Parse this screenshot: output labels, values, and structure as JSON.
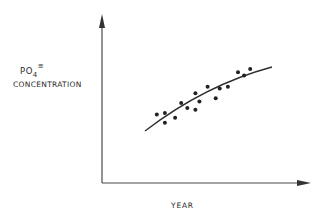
{
  "chart_data": {
    "type": "scatter",
    "title": "",
    "xlabel": "YEAR",
    "ylabel": "PO4≡ CONCENTRATION",
    "ylabel_parts": {
      "chem": "PO",
      "subscript": "4",
      "superscript": "≡",
      "line2": "CONCENTRATION"
    },
    "axes": {
      "ticks": false,
      "tick_labels": false,
      "grid": false,
      "arrows": true
    },
    "note": "Qualitative schematic: no numeric scale. Point coordinates are relative positions (0-100) within the plot area.",
    "points": [
      {
        "x": 27,
        "y": 42
      },
      {
        "x": 31,
        "y": 43
      },
      {
        "x": 31,
        "y": 37
      },
      {
        "x": 36,
        "y": 40
      },
      {
        "x": 39,
        "y": 49
      },
      {
        "x": 42,
        "y": 46
      },
      {
        "x": 46,
        "y": 55
      },
      {
        "x": 46,
        "y": 45
      },
      {
        "x": 48,
        "y": 50
      },
      {
        "x": 52,
        "y": 59
      },
      {
        "x": 56,
        "y": 52
      },
      {
        "x": 58,
        "y": 58
      },
      {
        "x": 62,
        "y": 59
      },
      {
        "x": 67,
        "y": 68
      },
      {
        "x": 70,
        "y": 66
      },
      {
        "x": 73,
        "y": 70
      }
    ],
    "trend_line": {
      "shape": "concave increasing curve",
      "from": {
        "x": 26,
        "y": 35
      },
      "to": {
        "x": 78,
        "y": 71
      }
    },
    "legend": null
  }
}
